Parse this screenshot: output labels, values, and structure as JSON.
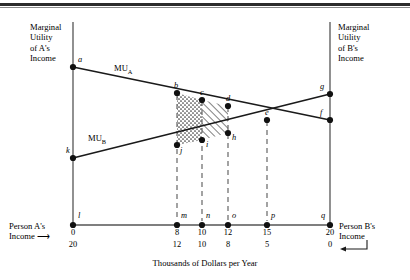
{
  "figure": {
    "axis_titles": {
      "left": "Marginal\nUtility\nof A's\nIncome",
      "left_line1": "Marginal",
      "left_line2": "Utility",
      "left_line3": "of A's",
      "left_line4": "Income",
      "right_line1": "Marginal",
      "right_line2": "Utility",
      "right_line3": "of B's",
      "right_line4": "Income",
      "xaxis": "Thousands of Dollars per Year"
    },
    "corner_labels": {
      "left_line1": "Person A's",
      "left_line2": "Income",
      "left_arrow": "⟶",
      "right_line1": "Person B's",
      "right_line2": "Income",
      "right_arrow": "⟵"
    },
    "curve_labels": {
      "mu_a_prefix": "MU",
      "mu_a_sub": "A",
      "mu_b_prefix": "MU",
      "mu_b_sub": "B"
    },
    "point_labels": {
      "a": "a",
      "b": "b",
      "c": "c",
      "d": "d",
      "e": "e",
      "f": "f",
      "g": "g",
      "h": "h",
      "i": "i",
      "j": "j",
      "k": "k",
      "l": "l",
      "m": "m",
      "n": "n",
      "o": "o",
      "p": "p",
      "q": "q"
    },
    "colors": {
      "line": "#1a1a1a",
      "axis": "#555555",
      "dash": "#666666",
      "rule": "#2b2b2b",
      "background": "#ffffff"
    }
  },
  "chart_data": {
    "type": "line",
    "title": "",
    "xlabel": "Thousands of Dollars per Year",
    "ylabel_left": "Marginal Utility of A's Income",
    "ylabel_right": "Marginal Utility of B's Income",
    "grid": false,
    "legend": "inline-curve-labels",
    "x_axis": {
      "person_a_income_label": "Person A's Income",
      "person_b_income_label": "Person B's Income",
      "ticks": [
        {
          "point": "l",
          "person_a": 0,
          "person_b": 20
        },
        {
          "point": "m",
          "person_a": 8,
          "person_b": 12
        },
        {
          "point": "n",
          "person_a": 10,
          "person_b": 10
        },
        {
          "point": "o",
          "person_a": 12,
          "person_b": 8
        },
        {
          "point": "p",
          "person_a": 15,
          "person_b": 5
        },
        {
          "point": "q",
          "person_a": 20,
          "person_b": 0
        }
      ]
    },
    "series": [
      {
        "name": "MU_A",
        "description": "Marginal utility of A's income, downward sloping from a to f",
        "points": [
          {
            "label": "a",
            "x": 0,
            "y": 100
          },
          {
            "label": "b",
            "x": 8,
            "y": 71
          },
          {
            "label": "c",
            "x": 10,
            "y": 67
          },
          {
            "label": "d",
            "x": 12,
            "y": 63
          },
          {
            "label": "e",
            "x": 15,
            "y": 55
          },
          {
            "label": "f",
            "x": 20,
            "y": 45
          }
        ]
      },
      {
        "name": "MU_B",
        "description": "Marginal utility of B's income, upward sloping from k to g",
        "points": [
          {
            "label": "k",
            "x": 0,
            "y": 36
          },
          {
            "label": "j",
            "x": 8,
            "y": 45
          },
          {
            "label": "i",
            "x": 10,
            "y": 48
          },
          {
            "label": "h",
            "x": 12,
            "y": 52
          },
          {
            "label": "e",
            "x": 15,
            "y": 55
          },
          {
            "label": "g",
            "x": 20,
            "y": 62
          }
        ]
      }
    ],
    "annotations": [
      {
        "name": "stippled-region",
        "vertices": [
          "b",
          "c",
          "i",
          "j"
        ],
        "pattern": "dotted"
      },
      {
        "name": "hatched-region",
        "vertices": [
          "c",
          "d",
          "h",
          "i"
        ],
        "pattern": "diagonal-hatch"
      },
      {
        "name": "intersection",
        "point": "e",
        "x": 15,
        "note": "MU_A equals MU_B"
      }
    ]
  }
}
